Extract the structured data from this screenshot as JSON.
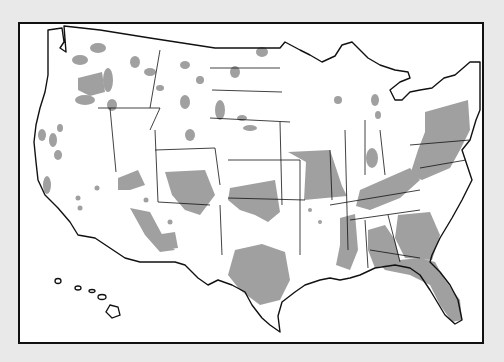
{
  "map": {
    "subject": "United States (contiguous 48 states with Hawaii inset)",
    "colors": {
      "background": "#e9e9e9",
      "land": "#ffffff",
      "shaded_regions": "#a0a0a0",
      "outline": "#111111"
    },
    "shaded_regions_desc": [
      "Missouri (most of state)",
      "Pennsylvania / West Virginia / Virginia",
      "Florida peninsula",
      "Alabama / Mississippi / Georgia south",
      "Texas Hill Country",
      "Oklahoma / Kansas",
      "Arizona / New Mexico / Colorado",
      "scattered patches across the northern states"
    ]
  }
}
